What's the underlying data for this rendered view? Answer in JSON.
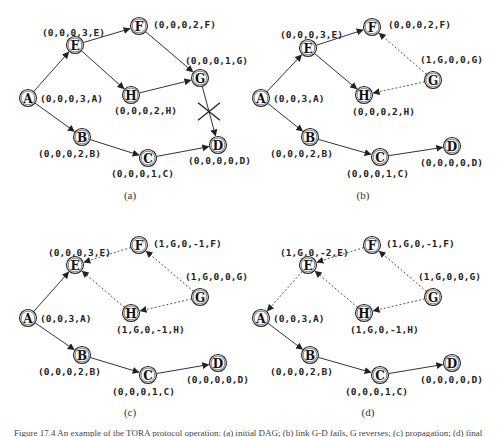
{
  "figure": {
    "caption": "Figure 17.4  An example of the TORA protocol operation: (a) initial DAG; (b) link G-D fails, G reverses; (c) propagation; (d) final",
    "panels": [
      {
        "id": "a",
        "label": "(a)",
        "nodes": [
          {
            "id": "A",
            "x": 28,
            "y": 98,
            "label": "(0,0,0,3,A)",
            "lx": 40,
            "ly": 102
          },
          {
            "id": "E",
            "x": 75,
            "y": 45,
            "label": "(0,0,0,3,E)",
            "lx": 42,
            "ly": 36
          },
          {
            "id": "F",
            "x": 139,
            "y": 26,
            "label": "(0,0,0,2,F)",
            "lx": 153,
            "ly": 28
          },
          {
            "id": "H",
            "x": 131,
            "y": 95,
            "label": "(0,0,0,2,H)",
            "lx": 114,
            "ly": 114
          },
          {
            "id": "G",
            "x": 200,
            "y": 78,
            "label": "(0,0,0,1,G)",
            "lx": 185,
            "ly": 64
          },
          {
            "id": "B",
            "x": 82,
            "y": 137,
            "label": "(0,0,0,2,B)",
            "lx": 38,
            "ly": 157
          },
          {
            "id": "C",
            "x": 148,
            "y": 158,
            "label": "(0,0,0,1,C)",
            "lx": 111,
            "ly": 177
          },
          {
            "id": "D",
            "x": 218,
            "y": 145,
            "label": "(0,0,0,0,D)",
            "lx": 188,
            "ly": 164
          }
        ],
        "edges": [
          {
            "from": "A",
            "to": "E",
            "style": "solid"
          },
          {
            "from": "A",
            "to": "B",
            "style": "solid"
          },
          {
            "from": "E",
            "to": "F",
            "style": "solid"
          },
          {
            "from": "E",
            "to": "H",
            "style": "solid"
          },
          {
            "from": "F",
            "to": "G",
            "style": "solid"
          },
          {
            "from": "H",
            "to": "G",
            "style": "solid"
          },
          {
            "from": "G",
            "to": "D",
            "style": "solid",
            "broken": true
          },
          {
            "from": "B",
            "to": "C",
            "style": "solid"
          },
          {
            "from": "C",
            "to": "D",
            "style": "solid"
          }
        ]
      },
      {
        "id": "b",
        "label": "(b)",
        "nodes": [
          {
            "id": "A",
            "x": 261,
            "y": 98,
            "label": "(0,0,3,A)",
            "lx": 273,
            "ly": 102
          },
          {
            "id": "E",
            "x": 308,
            "y": 48,
            "label": "(0,0,0,3,E)",
            "lx": 280,
            "ly": 38
          },
          {
            "id": "F",
            "x": 372,
            "y": 27,
            "label": "(0,0,0,2,F)",
            "lx": 388,
            "ly": 28
          },
          {
            "id": "H",
            "x": 364,
            "y": 95,
            "label": "(0,0,0,2,H)",
            "lx": 352,
            "ly": 115
          },
          {
            "id": "G",
            "x": 433,
            "y": 80,
            "label": "(1,G,0,0,G)",
            "lx": 420,
            "ly": 63
          },
          {
            "id": "B",
            "x": 310,
            "y": 137,
            "label": "(0,0,0,2,B)",
            "lx": 270,
            "ly": 157
          },
          {
            "id": "C",
            "x": 380,
            "y": 157,
            "label": "(0,0,0,1,C)",
            "lx": 346,
            "ly": 177
          },
          {
            "id": "D",
            "x": 452,
            "y": 146,
            "label": "(0,0,0,0,D)",
            "lx": 420,
            "ly": 166
          }
        ],
        "edges": [
          {
            "from": "A",
            "to": "E",
            "style": "solid"
          },
          {
            "from": "A",
            "to": "B",
            "style": "solid"
          },
          {
            "from": "E",
            "to": "F",
            "style": "solid"
          },
          {
            "from": "E",
            "to": "H",
            "style": "solid"
          },
          {
            "from": "G",
            "to": "F",
            "style": "dashed"
          },
          {
            "from": "G",
            "to": "H",
            "style": "dashed"
          },
          {
            "from": "B",
            "to": "C",
            "style": "solid"
          },
          {
            "from": "C",
            "to": "D",
            "style": "solid"
          }
        ]
      },
      {
        "id": "c",
        "label": "(c)",
        "nodes": [
          {
            "id": "A",
            "x": 28,
            "y": 318,
            "label": "(0,0,3,A)",
            "lx": 40,
            "ly": 322
          },
          {
            "id": "E",
            "x": 75,
            "y": 265,
            "label": "(0,0,0,3,E)",
            "lx": 48,
            "ly": 256
          },
          {
            "id": "F",
            "x": 139,
            "y": 245,
            "label": "(1,G,0,-1,F)",
            "lx": 153,
            "ly": 247
          },
          {
            "id": "H",
            "x": 131,
            "y": 313,
            "label": "(1,G,0,-1,H)",
            "lx": 116,
            "ly": 333
          },
          {
            "id": "G",
            "x": 200,
            "y": 297,
            "label": "(1,G,0,0,G)",
            "lx": 185,
            "ly": 280
          },
          {
            "id": "B",
            "x": 82,
            "y": 355,
            "label": "(0,0,0,2,B)",
            "lx": 38,
            "ly": 375
          },
          {
            "id": "C",
            "x": 148,
            "y": 375,
            "label": "(0,0,0,1,C)",
            "lx": 112,
            "ly": 395
          },
          {
            "id": "D",
            "x": 218,
            "y": 363,
            "label": "(0,0,0,0,D)",
            "lx": 186,
            "ly": 383
          }
        ],
        "edges": [
          {
            "from": "A",
            "to": "E",
            "style": "solid"
          },
          {
            "from": "A",
            "to": "B",
            "style": "solid"
          },
          {
            "from": "F",
            "to": "E",
            "style": "dashed"
          },
          {
            "from": "H",
            "to": "E",
            "style": "dashed"
          },
          {
            "from": "G",
            "to": "F",
            "style": "dashed"
          },
          {
            "from": "G",
            "to": "H",
            "style": "dashed"
          },
          {
            "from": "B",
            "to": "C",
            "style": "solid"
          },
          {
            "from": "C",
            "to": "D",
            "style": "solid"
          }
        ]
      },
      {
        "id": "d",
        "label": "(d)",
        "nodes": [
          {
            "id": "A",
            "x": 261,
            "y": 318,
            "label": "(0,0,3,A)",
            "lx": 273,
            "ly": 322
          },
          {
            "id": "E",
            "x": 308,
            "y": 265,
            "label": "(1,G,0,-2,E)",
            "lx": 280,
            "ly": 256
          },
          {
            "id": "F",
            "x": 372,
            "y": 245,
            "label": "(1,G,0,-1,F)",
            "lx": 386,
            "ly": 247
          },
          {
            "id": "H",
            "x": 364,
            "y": 313,
            "label": "(1,G,0,-1,H)",
            "lx": 350,
            "ly": 333
          },
          {
            "id": "G",
            "x": 433,
            "y": 297,
            "label": "(1,G,0,0,G)",
            "lx": 418,
            "ly": 280
          },
          {
            "id": "B",
            "x": 310,
            "y": 355,
            "label": "(0,0,0,2,B)",
            "lx": 270,
            "ly": 375
          },
          {
            "id": "C",
            "x": 380,
            "y": 375,
            "label": "(0,0,0,1,C)",
            "lx": 345,
            "ly": 395
          },
          {
            "id": "D",
            "x": 452,
            "y": 363,
            "label": "(0,0,0,0,D)",
            "lx": 420,
            "ly": 383
          }
        ],
        "edges": [
          {
            "from": "E",
            "to": "A",
            "style": "dashed"
          },
          {
            "from": "A",
            "to": "B",
            "style": "solid"
          },
          {
            "from": "F",
            "to": "E",
            "style": "dashed"
          },
          {
            "from": "H",
            "to": "E",
            "style": "dashed"
          },
          {
            "from": "G",
            "to": "F",
            "style": "dashed"
          },
          {
            "from": "G",
            "to": "H",
            "style": "dashed"
          },
          {
            "from": "B",
            "to": "C",
            "style": "solid"
          },
          {
            "from": "C",
            "to": "D",
            "style": "solid"
          }
        ]
      }
    ],
    "panel_caption_positions": [
      {
        "x": 130,
        "y": 199
      },
      {
        "x": 363,
        "y": 199
      },
      {
        "x": 130,
        "y": 416
      },
      {
        "x": 368,
        "y": 416
      }
    ]
  }
}
